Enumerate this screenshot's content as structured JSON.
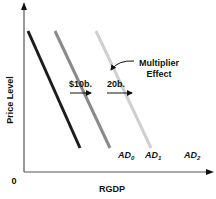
{
  "diagram": {
    "y_axis": {
      "label": "Price Level"
    },
    "x_axis": {
      "label": "RGDP"
    },
    "origin_label": "0",
    "curves": [
      {
        "name": "AD",
        "subscript": "0",
        "color": "#1c1c1c"
      },
      {
        "name": "AD",
        "subscript": "1",
        "color": "#8a8a8a"
      },
      {
        "name": "AD",
        "subscript": "2",
        "color": "#cfcfcf"
      }
    ],
    "shift_labels": {
      "first": "$10b.",
      "second": "20b."
    },
    "annotation": {
      "line1": "Multiplier",
      "line2": "Effect"
    }
  }
}
